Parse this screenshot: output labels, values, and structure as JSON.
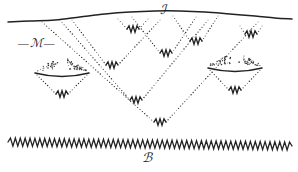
{
  "figure": {
    "title": "",
    "labels": {
      "interface": "ℐ",
      "bulk": "ℬ",
      "region": "—ℳ—",
      "region_letter": "ℳ"
    },
    "colors": {
      "ink": "#1a1a1a",
      "line": "#222222",
      "dotted": "#333333",
      "background": "#ffffff"
    }
  },
  "chart_data": {
    "type": "diagram",
    "title": "",
    "xlabel": "",
    "ylabel": "",
    "top_surface": {
      "name": "interface-curve",
      "label": "ℐ",
      "label_x": 163,
      "label_y": 8,
      "points": [
        [
          8,
          22
        ],
        [
          30,
          21
        ],
        [
          55,
          20
        ],
        [
          80,
          17
        ],
        [
          105,
          14
        ],
        [
          130,
          12
        ],
        [
          155,
          11
        ],
        [
          180,
          11
        ],
        [
          205,
          12
        ],
        [
          230,
          14
        ],
        [
          255,
          16
        ],
        [
          275,
          18
        ],
        [
          292,
          19
        ]
      ]
    },
    "bottom_surface": {
      "name": "bulk-zigzag",
      "label": "ℬ",
      "label_x": 146,
      "label_y": 152,
      "y_left": 142,
      "y_right": 146,
      "x_start": 8,
      "x_end": 292,
      "teeth": 58,
      "amplitude": 4
    },
    "region_label": {
      "name": "region-M",
      "text": "—ℳ—",
      "x": 20,
      "y": 40
    },
    "cones": [
      {
        "id": "cone-1",
        "left_x": 118,
        "top_y": 19,
        "right_x": 148,
        "vertex_x": 133,
        "vertex_y": 29
      },
      {
        "id": "cone-2",
        "left_x": 240,
        "top_y": 26,
        "right_x": 262,
        "vertex_x": 251,
        "vertex_y": 34
      },
      {
        "id": "cone-3",
        "left_x": 173,
        "top_y": 16,
        "right_x": 218,
        "vertex_x": 196,
        "vertex_y": 41
      },
      {
        "id": "cone-4",
        "left_x": 132,
        "top_y": 17,
        "right_x": 196,
        "vertex_x": 166,
        "vertex_y": 53
      },
      {
        "id": "cone-5",
        "left_x": 72,
        "top_y": 20,
        "right_x": 160,
        "vertex_x": 112,
        "vertex_y": 65
      },
      {
        "id": "cone-6",
        "left_x": 60,
        "top_y": 20,
        "right_x": 208,
        "vertex_x": 136,
        "vertex_y": 100
      },
      {
        "id": "cone-7",
        "left_x": 42,
        "top_y": 22,
        "right_x": 258,
        "vertex_x": 160,
        "vertex_y": 122
      }
    ],
    "cups": [
      {
        "id": "cup-left",
        "cx": 62,
        "rim_y": 73,
        "rim_half_width": 27,
        "rim_sag": 7,
        "vertex_y": 94,
        "dot_count": 70
      },
      {
        "id": "cup-right",
        "cx": 235,
        "rim_y": 68,
        "rim_half_width": 27,
        "rim_sag": 7,
        "vertex_y": 90,
        "dot_count": 70
      }
    ],
    "zigzag_marker": {
      "teeth": 3,
      "width": 12,
      "amplitude": 3.2
    }
  }
}
